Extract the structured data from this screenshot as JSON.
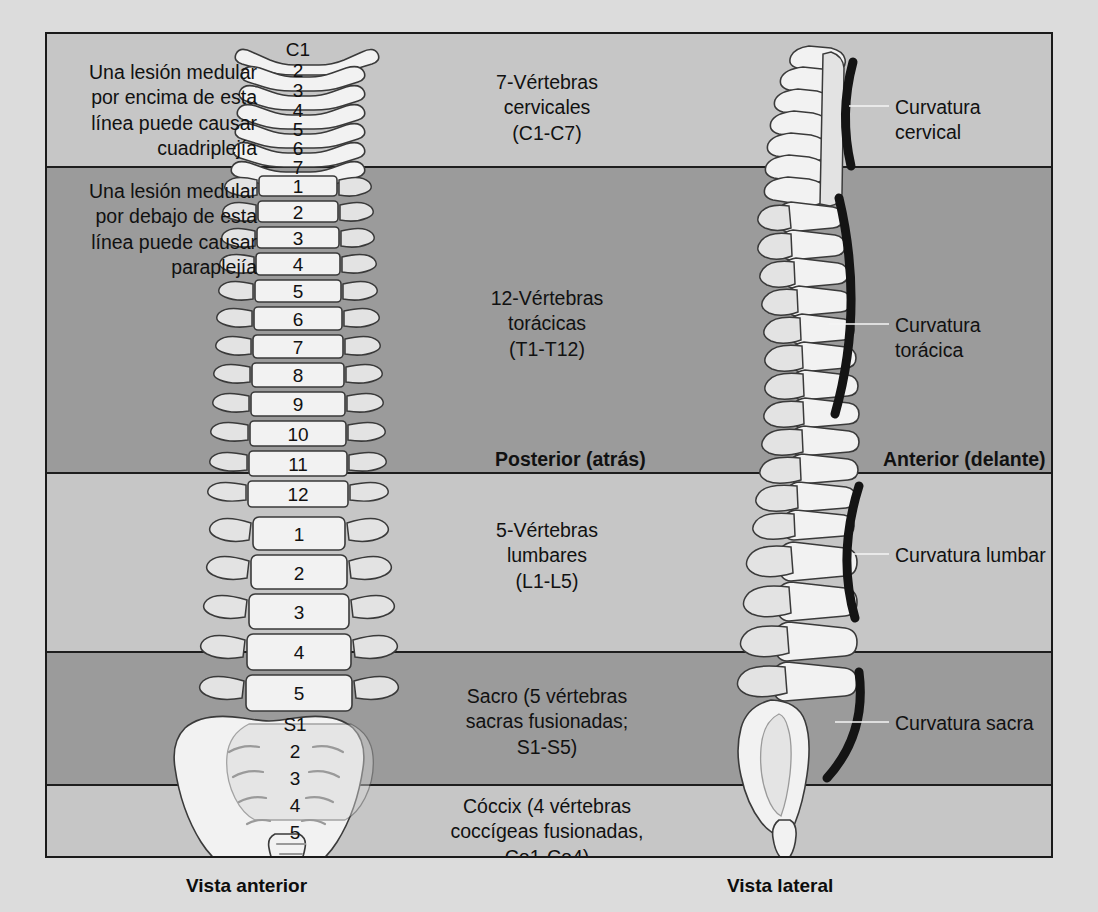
{
  "diagram": {
    "notes": {
      "above": "Una lesión medular por encima de esta línea puede causar cuadriplejía",
      "below": "Una lesión medular por debajo de esta línea puede causar paraplejía"
    },
    "sections": [
      {
        "id": "cervical",
        "lines": [
          "7-Vértebras",
          "cervicales",
          "(C1-C7)"
        ],
        "shade": "light"
      },
      {
        "id": "thoracic",
        "lines": [
          "12-Vértebras",
          "torácicas",
          "(T1-T12)"
        ],
        "shade": "dark"
      },
      {
        "id": "lumbar",
        "lines": [
          "5-Vértebras",
          "lumbares",
          "(L1-L5)"
        ],
        "shade": "light"
      },
      {
        "id": "sacral",
        "lines": [
          "Sacro (5 vértebras",
          "sacras fusionadas;",
          "S1-S5)"
        ],
        "shade": "dark"
      },
      {
        "id": "coccyx",
        "lines": [
          "Cóccix (4 vértebras",
          "coccígeas fusionadas,",
          "Co1-Co4)"
        ],
        "shade": "light"
      }
    ],
    "curvatures": [
      {
        "id": "cervical",
        "label": "Curvatura cervical"
      },
      {
        "id": "thoracic",
        "label": "Curvatura torácica"
      },
      {
        "id": "lumbar",
        "label": "Curvatura lumbar"
      },
      {
        "id": "sacral",
        "label": "Curvatura sacra"
      }
    ],
    "orientation": {
      "posterior": "Posterior (atrás)",
      "anterior": "Anterior (delante)"
    },
    "captions": {
      "anterior_view": "Vista anterior",
      "lateral_view": "Vista lateral"
    },
    "vertebra_numbers": {
      "cervical": [
        "C1",
        "2",
        "3",
        "4",
        "5",
        "6",
        "7"
      ],
      "thoracic": [
        "1",
        "2",
        "3",
        "4",
        "5",
        "6",
        "7",
        "8",
        "9",
        "10",
        "11",
        "12"
      ],
      "lumbar": [
        "1",
        "2",
        "3",
        "4",
        "5"
      ],
      "sacral": [
        "S1",
        "2",
        "3",
        "4",
        "5"
      ]
    },
    "colors": {
      "band_light": "#c6c6c6",
      "band_dark": "#9b9b9b",
      "page_background": "#dcdcdc",
      "frame_border": "#1a1a1a",
      "bone_fill": "#f2f2f2",
      "bone_outline": "#3a3a3a",
      "curvature_marker": "#141414",
      "text": "#111111"
    }
  }
}
